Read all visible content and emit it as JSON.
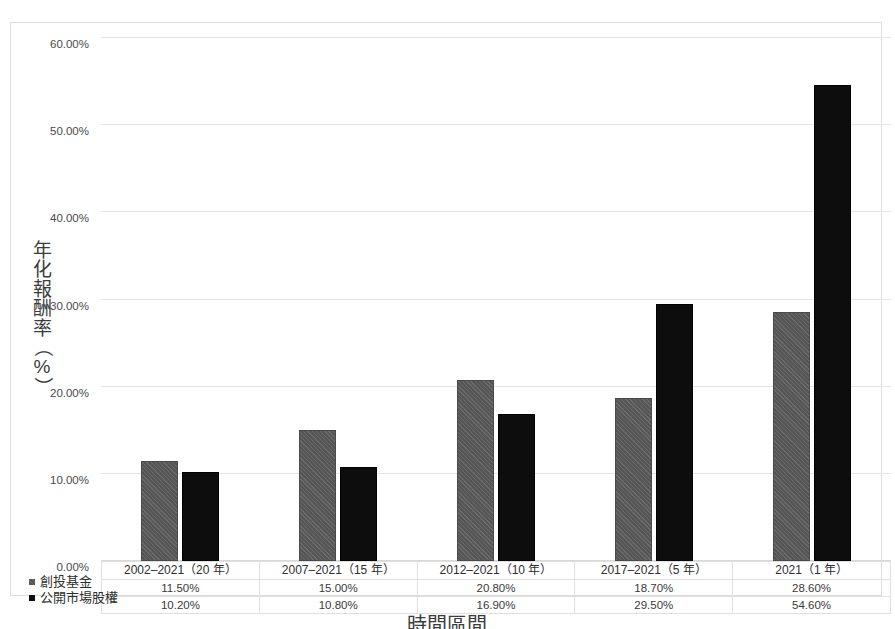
{
  "chart_data": {
    "type": "bar",
    "title": "",
    "xlabel": "時間區間",
    "ylabel": "年化報酬率（%）",
    "ylim": [
      0,
      60
    ],
    "ytick_labels": [
      "0.00%",
      "10.00%",
      "20.00%",
      "30.00%",
      "40.00%",
      "50.00%",
      "60.00%"
    ],
    "ytick_values": [
      0,
      10,
      20,
      30,
      40,
      50,
      60
    ],
    "grid": true,
    "legend_position": "bottom-left",
    "categories": [
      "2002–2021（20 年）",
      "2007–2021（15 年）",
      "2012–2021（10 年）",
      "2017–2021（5 年）",
      "2021（1 年）"
    ],
    "series": [
      {
        "name": "創投基金",
        "color": "#555555",
        "values": [
          11.5,
          15.0,
          20.8,
          18.7,
          28.6
        ],
        "value_labels": [
          "11.50%",
          "15.00%",
          "20.80%",
          "18.70%",
          "28.60%"
        ]
      },
      {
        "name": "公開市場股權",
        "color": "#0d0d0d",
        "values": [
          10.2,
          10.8,
          16.9,
          29.5,
          54.6
        ],
        "value_labels": [
          "10.20%",
          "10.80%",
          "16.90%",
          "29.50%",
          "54.60%"
        ]
      }
    ]
  },
  "axis": {
    "y_title_chars": [
      "年",
      "化",
      "報",
      "酬",
      "率",
      "（",
      "%",
      "）"
    ],
    "x_title": "時間區間"
  },
  "caption": {
    "text": ""
  }
}
